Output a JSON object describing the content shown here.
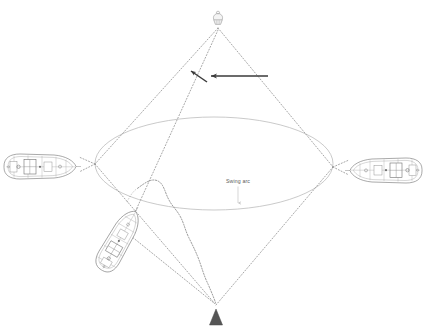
{
  "diagram": {
    "background_color": "#ffffff",
    "labels": {
      "swing_arc": "Swing arc"
    },
    "colors": {
      "dotted_line": "#8a8a8a",
      "swing_arc_curve": "#b9b9b9",
      "chain_line": "#6f6f6f",
      "arrow": "#3a3a3a",
      "vessel_outline": "#7b7b7b",
      "vessel_detail": "#9a9a9a",
      "anchor_marker": "#4a4a4a",
      "buoy_marker": "#b0b0b0",
      "label_text": "#5a5a5a",
      "leader_line": "#bdbdbd"
    },
    "geometry": {
      "apex_top": {
        "x": 218,
        "y": 26
      },
      "apex_bottom": {
        "x": 216,
        "y": 305
      },
      "vertex_left": {
        "x": 95,
        "y": 164
      },
      "vertex_right": {
        "x": 333,
        "y": 167
      },
      "swing_arc_ellipse": {
        "left_x": 95,
        "right_x": 333,
        "top_y": 117,
        "bottom_y": 210,
        "center": {
          "x": 214,
          "y": 164
        }
      },
      "arrow_long": {
        "from_x": 268,
        "from_y": 76,
        "to_x": 208,
        "to_y": 76
      },
      "arrow_short": {
        "from_x": 207,
        "from_y": 82,
        "to_x": 188,
        "to_y": 70
      },
      "label_leader": {
        "from_x": 238,
        "from_y": 186,
        "to_x": 238,
        "to_y": 206
      }
    },
    "markers": [
      {
        "name": "mooring-buoy",
        "position": "top-apex",
        "shape": "buoy",
        "x": 218,
        "y": 18
      },
      {
        "name": "anchor",
        "position": "bottom-apex",
        "shape": "triangle",
        "x": 216,
        "y": 320
      }
    ],
    "vessels": [
      {
        "id": "vessel-left",
        "orientation_deg": 0,
        "x": 40,
        "y": 167,
        "length": 72,
        "beam": 26,
        "description": "ship plan view port side"
      },
      {
        "id": "vessel-right",
        "orientation_deg": 180,
        "x": 385,
        "y": 170,
        "length": 72,
        "beam": 26,
        "description": "ship plan view starboard side"
      },
      {
        "id": "vessel-lower-left",
        "orientation_deg": -58,
        "x": 118,
        "y": 240,
        "length": 66,
        "beam": 24,
        "description": "ship plan view swung position"
      }
    ],
    "lines": {
      "mooring_lines_count": 8,
      "style": "dotted",
      "chain_catenary": "wavy line from centre to bottom apex"
    }
  }
}
